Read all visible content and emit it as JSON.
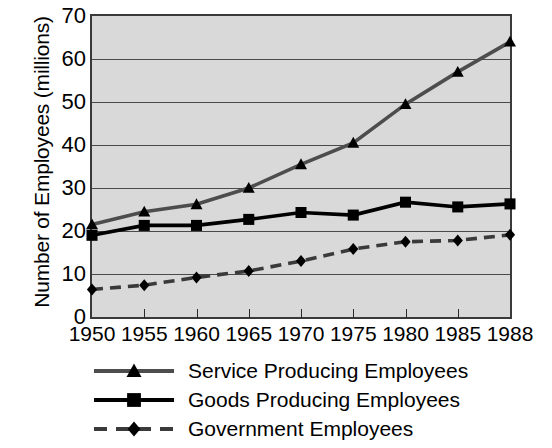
{
  "chart_data": {
    "type": "line",
    "title": "",
    "xlabel": "",
    "ylabel": "Number of Employees (millions)",
    "categories": [
      "1950",
      "1955",
      "1960",
      "1965",
      "1970",
      "1975",
      "1980",
      "1985",
      "1988"
    ],
    "x": [
      1950,
      1955,
      1960,
      1965,
      1970,
      1975,
      1980,
      1985,
      1988
    ],
    "ylim": [
      0,
      70
    ],
    "yticks": [
      0,
      10,
      20,
      30,
      40,
      50,
      60,
      70
    ],
    "grid": true,
    "legend_position": "below",
    "series": [
      {
        "name": "Service Producing Employees",
        "marker": "triangle",
        "line_style": "solid",
        "color": "#4d4d4d",
        "values": [
          21.5,
          24.5,
          26.2,
          30.0,
          35.5,
          40.5,
          49.5,
          57.0,
          64.0
        ]
      },
      {
        "name": "Goods Producing Employees",
        "marker": "square",
        "line_style": "solid",
        "color": "#000000",
        "values": [
          19.0,
          21.3,
          21.3,
          22.7,
          24.3,
          23.7,
          26.7,
          25.6,
          26.3
        ]
      },
      {
        "name": "Government Employees",
        "marker": "diamond",
        "line_style": "dashed",
        "color": "#3a3a3a",
        "values": [
          6.4,
          7.4,
          9.2,
          10.7,
          13.0,
          15.8,
          17.5,
          17.8,
          19.1
        ]
      }
    ]
  },
  "legend": {
    "items": [
      {
        "label": "Service Producing Employees"
      },
      {
        "label": "Goods Producing Employees"
      },
      {
        "label": "Government Employees"
      }
    ]
  },
  "axis": {
    "y_title": "Number of Employees (millions)",
    "y_ticks": [
      "0",
      "10",
      "20",
      "30",
      "40",
      "50",
      "60",
      "70"
    ],
    "x_ticks": [
      "1950",
      "1955",
      "1960",
      "1965",
      "1970",
      "1975",
      "1980",
      "1985",
      "1988"
    ]
  },
  "colors": {
    "plot_background": "#d9d9d9",
    "frame": "#3a3a3a",
    "gridline": "#4a4a4a",
    "service": "#4d4d4d",
    "goods": "#000000",
    "government": "#3a3a3a",
    "page_background": "#ffffff"
  }
}
